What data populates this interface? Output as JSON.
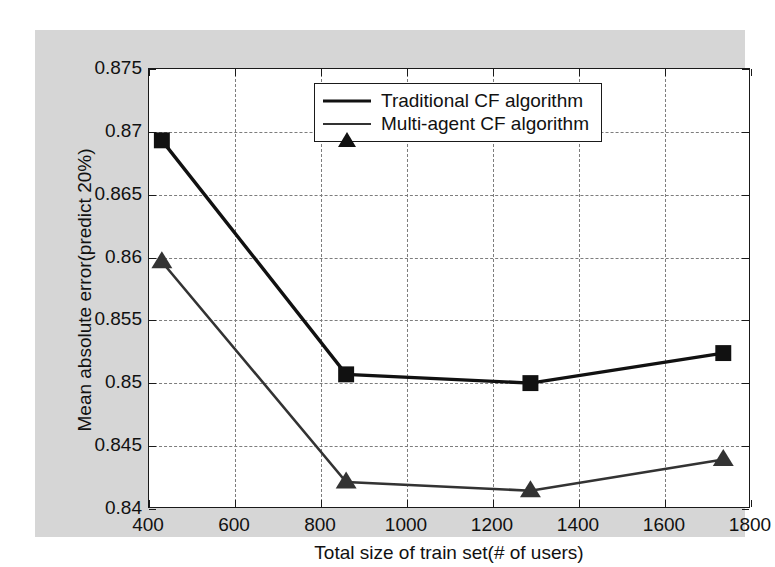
{
  "chart_data": {
    "type": "line",
    "title": "",
    "xlabel": "Total size of train set(# of users)",
    "ylabel": "Mean absolute error(predict 20%)",
    "xlim": [
      400,
      1800
    ],
    "ylim": [
      0.84,
      0.875
    ],
    "grid": true,
    "legend_position": "top-center",
    "xticks": [
      400,
      600,
      800,
      1000,
      1200,
      1400,
      1600,
      1800
    ],
    "xtick_labels": [
      "400",
      "600",
      "800",
      "1000",
      "1200",
      "1400",
      "1600",
      "1800"
    ],
    "yticks": [
      0.84,
      0.845,
      0.85,
      0.855,
      0.86,
      0.865,
      0.87,
      0.875
    ],
    "ytick_labels": [
      "0.84",
      "0.845",
      "0.85",
      "0.855",
      "0.86",
      "0.865",
      "0.87",
      "0.875"
    ],
    "x": [
      430,
      860,
      1290,
      1740
    ],
    "series": [
      {
        "name": "Traditional CF algorithm",
        "marker": "square",
        "color": "#111111",
        "values": [
          0.8693,
          0.8506,
          0.8499,
          0.8523
        ]
      },
      {
        "name": "Multi-agent CF algorithm",
        "marker": "triangle",
        "color": "#333333",
        "values": [
          0.8596,
          0.842,
          0.8413,
          0.8438
        ]
      }
    ]
  },
  "legend": {
    "entries": [
      {
        "label": "Traditional CF algorithm",
        "marker": "square-marker-icon"
      },
      {
        "label": "Multi-agent CF algorithm",
        "marker": "triangle-marker-icon"
      }
    ]
  },
  "colors": {
    "figure_background": "#d6d6d6",
    "plot_background": "#ffffff",
    "axis": "#1a1a1a",
    "grid": "#7d7d7d",
    "series_1": "#111111",
    "series_2": "#333333"
  }
}
